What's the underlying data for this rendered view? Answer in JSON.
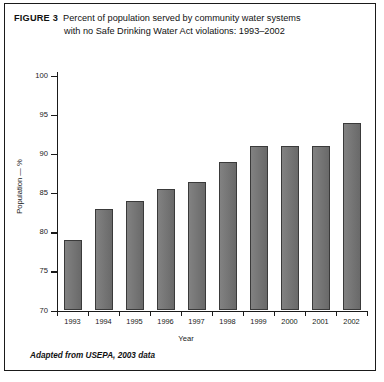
{
  "figure": {
    "label": "FIGURE 3",
    "caption_line_1": "Percent of population served by community water systems",
    "caption_line_2": "with no Safe Drinking Water Act violations: 1993–2002",
    "source_note": "Adapted from USEPA, 2003 data",
    "border_color": "#1a1a1a"
  },
  "chart_data": {
    "type": "bar",
    "title": "Percent of population served by community water systems with no Safe Drinking Water Act violations: 1993–2002",
    "categories": [
      "1993",
      "1994",
      "1995",
      "1996",
      "1997",
      "1998",
      "1999",
      "2000",
      "2001",
      "2002"
    ],
    "values": [
      79,
      83,
      84,
      85.5,
      86.5,
      89,
      91,
      91,
      91,
      94
    ],
    "xlabel": "Year",
    "ylabel": "Population — %",
    "ylim": [
      70,
      100
    ],
    "yticks": [
      70,
      75,
      80,
      85,
      90,
      95,
      100
    ],
    "ytick_labels": [
      "70",
      "75",
      "80",
      "85",
      "90",
      "95",
      "100"
    ],
    "grid": false,
    "legend": null,
    "bar_color": "#6f6f6f",
    "bar_edge_color": "#3a3a3a"
  }
}
